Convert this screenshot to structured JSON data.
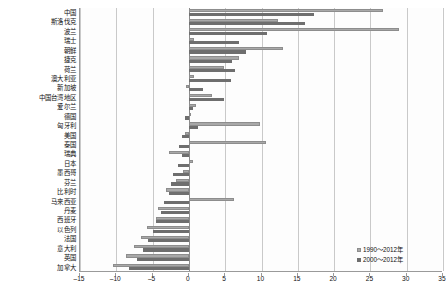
{
  "chart_data": {
    "type": "bar",
    "orientation": "horizontal",
    "title": "",
    "xlabel": "",
    "ylabel": "",
    "xlim": [
      -15,
      35
    ],
    "xticks": [
      -15,
      -10,
      -5,
      0,
      5,
      10,
      15,
      20,
      25,
      30,
      35
    ],
    "grid": true,
    "legend_position": "bottom-right",
    "categories": [
      "中国",
      "斯洛伐克",
      "波兰",
      "瑞士",
      "朝鲜",
      "捷克",
      "荷兰",
      "澳大利亚",
      "新加坡",
      "中国台湾地区",
      "爱尔兰",
      "德国",
      "匈牙利",
      "美国",
      "泰国",
      "瑞典",
      "日本",
      "墨西哥",
      "芬兰",
      "比利时",
      "马来西亚",
      "丹麦",
      "西班牙",
      "以色列",
      "法国",
      "意大利",
      "英国",
      "加拿大"
    ],
    "series": [
      {
        "name": "1990～2012年",
        "color": "#a8a8a8",
        "values": [
          26.7,
          12.3,
          28.9,
          0.7,
          13.0,
          6.9,
          4.9,
          0.7,
          -0.4,
          3.2,
          1.0,
          0.3,
          9.8,
          -0.5,
          10.6,
          -2.7,
          0.5,
          -0.8,
          -1.8,
          -3.1,
          6.2,
          -4.2,
          -4.6,
          -5.8,
          -6.6,
          -7.6,
          -8.6,
          -10.4
        ]
      },
      {
        "name": "2000～2012年",
        "color": "#6e6e6e",
        "values": [
          17.2,
          16.0,
          10.8,
          6.9,
          7.9,
          6.0,
          6.4,
          5.8,
          2.0,
          4.9,
          0.5,
          -0.5,
          1.3,
          -0.9,
          -1.4,
          -0.9,
          -1.5,
          -2.2,
          -2.4,
          -2.8,
          -3.4,
          -3.8,
          -4.5,
          -5.0,
          -5.6,
          -6.3,
          -7.2,
          -8.2
        ]
      }
    ],
    "legend": [
      {
        "label": "1990～2012年",
        "marker": "light-square"
      },
      {
        "label": "2000～2012年",
        "marker": "dark-square"
      }
    ]
  }
}
